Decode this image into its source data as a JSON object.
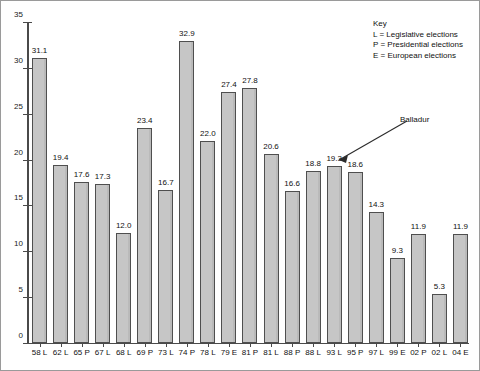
{
  "chart_data": {
    "type": "bar",
    "title": "",
    "subtitle": "",
    "xlabel": "",
    "ylabel": "",
    "ylim": [
      0,
      35
    ],
    "ytick_step": 5,
    "yticks": [
      0,
      5,
      10,
      15,
      20,
      25,
      30,
      35
    ],
    "grid": false,
    "legend_position": "top-right",
    "categories": [
      "58 L",
      "62 L",
      "65 P",
      "67 L",
      "68 L",
      "69 P",
      "73 L",
      "74 P",
      "78 L",
      "79 E",
      "81 P",
      "81 L",
      "88 P",
      "88 L",
      "93 L",
      "95 P",
      "97 L",
      "99 E",
      "02 P",
      "02 L",
      "04 E"
    ],
    "values": [
      31.1,
      19.4,
      17.6,
      17.3,
      12.0,
      23.4,
      16.7,
      32.9,
      22.0,
      27.4,
      27.8,
      20.6,
      16.6,
      18.8,
      19.3,
      18.6,
      14.3,
      9.3,
      11.9,
      5.3,
      11.9
    ],
    "value_labels": [
      "31.1",
      "19.4",
      "17.6",
      "17.3",
      "12.0",
      "23.4",
      "16.7",
      "32.9",
      "22.0",
      "27.4",
      "27.8",
      "20.6",
      "16.6",
      "18.8",
      "19.3",
      "18.6",
      "14.3",
      "9.3",
      "11.9",
      "5.3",
      "11.9"
    ],
    "bar_color": "#c6c6c6",
    "bar_border_color": "#4f4f4f",
    "axis_color": "#4a4a4a",
    "background_color": "#ffffff",
    "annotations": [
      {
        "text": "Balladur",
        "points_to_category": "95 P",
        "points_to_value": 18.6
      }
    ]
  },
  "key": {
    "title": "Key",
    "entries": [
      "L = Legislative elections",
      "P = Presidential elections",
      "E = European elections"
    ]
  },
  "annotation": {
    "balladur_label": "Balladur"
  }
}
